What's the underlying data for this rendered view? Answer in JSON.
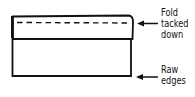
{
  "diagram": {
    "labels": [
      {
        "id": "fold",
        "lines": [
          "Fold",
          "tacked",
          "down"
        ]
      },
      {
        "id": "raw",
        "lines": [
          "Raw",
          "edges"
        ]
      }
    ],
    "colors": {
      "stroke": "#111111",
      "background": "#ffffff"
    }
  }
}
